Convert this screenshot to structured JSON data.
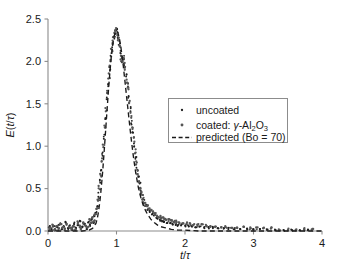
{
  "chart_data": {
    "type": "scatter",
    "title": "",
    "xlabel": "t/τ",
    "ylabel": "E(t/τ)",
    "xlim": [
      0,
      4
    ],
    "ylim": [
      0,
      2.5
    ],
    "xticks": [
      "0",
      "1",
      "2",
      "3",
      "4"
    ],
    "yticks": [
      "0.0",
      "0.5",
      "1.0",
      "1.5",
      "2.0",
      "2.5"
    ],
    "xtick_values": [
      0,
      1,
      2,
      3,
      4
    ],
    "ytick_values": [
      0.0,
      0.5,
      1.0,
      1.5,
      2.0,
      2.5
    ],
    "grid": false,
    "legend_position": "center-right",
    "series": [
      {
        "name": "uncoated",
        "type": "scatter",
        "marker": "dot",
        "color": "#1f1f1f",
        "points": [
          [
            0.02,
            0.05
          ],
          [
            0.05,
            0.02
          ],
          [
            0.08,
            0.06
          ],
          [
            0.11,
            0.01
          ],
          [
            0.14,
            0.04
          ],
          [
            0.17,
            0.08
          ],
          [
            0.2,
            0.02
          ],
          [
            0.23,
            0.05
          ],
          [
            0.26,
            0.1
          ],
          [
            0.29,
            0.03
          ],
          [
            0.32,
            0.06
          ],
          [
            0.35,
            0.02
          ],
          [
            0.38,
            0.09
          ],
          [
            0.41,
            0.04
          ],
          [
            0.44,
            0.07
          ],
          [
            0.47,
            0.12
          ],
          [
            0.5,
            0.05
          ],
          [
            0.53,
            0.08
          ],
          [
            0.56,
            0.03
          ],
          [
            0.59,
            0.11
          ],
          [
            0.62,
            0.07
          ],
          [
            0.64,
            0.14
          ],
          [
            0.66,
            0.1
          ],
          [
            0.68,
            0.18
          ],
          [
            0.7,
            0.22
          ],
          [
            0.72,
            0.3
          ],
          [
            0.74,
            0.42
          ],
          [
            0.76,
            0.58
          ],
          [
            0.78,
            0.74
          ],
          [
            0.8,
            0.92
          ],
          [
            0.82,
            1.12
          ],
          [
            0.84,
            1.32
          ],
          [
            0.86,
            1.55
          ],
          [
            0.88,
            1.74
          ],
          [
            0.9,
            1.92
          ],
          [
            0.92,
            2.08
          ],
          [
            0.94,
            2.2
          ],
          [
            0.96,
            2.3
          ],
          [
            0.98,
            2.35
          ],
          [
            1.0,
            2.36
          ],
          [
            1.02,
            2.3
          ],
          [
            1.04,
            2.22
          ],
          [
            1.06,
            2.1
          ],
          [
            1.08,
            2.02
          ],
          [
            1.1,
            2.05
          ],
          [
            1.12,
            1.95
          ],
          [
            1.14,
            1.84
          ],
          [
            1.16,
            1.72
          ],
          [
            1.18,
            1.58
          ],
          [
            1.2,
            1.44
          ],
          [
            1.22,
            1.28
          ],
          [
            1.24,
            1.14
          ],
          [
            1.26,
            1.0
          ],
          [
            1.28,
            0.86
          ],
          [
            1.3,
            0.74
          ],
          [
            1.32,
            0.63
          ],
          [
            1.34,
            0.54
          ],
          [
            1.36,
            0.46
          ],
          [
            1.38,
            0.4
          ],
          [
            1.4,
            0.34
          ],
          [
            1.43,
            0.3
          ],
          [
            1.46,
            0.26
          ],
          [
            1.49,
            0.23
          ],
          [
            1.52,
            0.2
          ],
          [
            1.55,
            0.18
          ],
          [
            1.58,
            0.16
          ],
          [
            1.61,
            0.15
          ],
          [
            1.64,
            0.13
          ],
          [
            1.67,
            0.12
          ],
          [
            1.7,
            0.11
          ],
          [
            1.74,
            0.1
          ],
          [
            1.78,
            0.09
          ],
          [
            1.82,
            0.08
          ],
          [
            1.86,
            0.08
          ],
          [
            1.9,
            0.07
          ],
          [
            1.95,
            0.07
          ],
          [
            2.0,
            0.06
          ],
          [
            2.05,
            0.06
          ],
          [
            2.1,
            0.05
          ],
          [
            2.16,
            0.05
          ],
          [
            2.22,
            0.05
          ],
          [
            2.28,
            0.04
          ],
          [
            2.34,
            0.04
          ],
          [
            2.4,
            0.04
          ],
          [
            2.48,
            0.03
          ],
          [
            2.56,
            0.03
          ],
          [
            2.64,
            0.03
          ],
          [
            2.72,
            0.03
          ],
          [
            2.8,
            0.02
          ],
          [
            2.9,
            0.02
          ],
          [
            3.0,
            0.02
          ],
          [
            3.1,
            0.02
          ],
          [
            3.2,
            0.02
          ],
          [
            3.32,
            0.01
          ],
          [
            3.44,
            0.01
          ],
          [
            3.56,
            0.01
          ],
          [
            3.68,
            0.01
          ],
          [
            3.8,
            0.01
          ]
        ]
      },
      {
        "name": "coated: γ-Al₂O₃",
        "type": "scatter",
        "marker": "dot",
        "color": "#555555",
        "points": [
          [
            0.03,
            0.03
          ],
          [
            0.07,
            0.07
          ],
          [
            0.1,
            0.02
          ],
          [
            0.13,
            0.05
          ],
          [
            0.16,
            0.02
          ],
          [
            0.19,
            0.07
          ],
          [
            0.22,
            0.04
          ],
          [
            0.25,
            0.02
          ],
          [
            0.28,
            0.08
          ],
          [
            0.31,
            0.04
          ],
          [
            0.34,
            0.03
          ],
          [
            0.37,
            0.06
          ],
          [
            0.4,
            0.02
          ],
          [
            0.43,
            0.1
          ],
          [
            0.46,
            0.05
          ],
          [
            0.49,
            0.03
          ],
          [
            0.52,
            0.09
          ],
          [
            0.55,
            0.06
          ],
          [
            0.58,
            0.04
          ],
          [
            0.61,
            0.13
          ],
          [
            0.63,
            0.09
          ],
          [
            0.65,
            0.16
          ],
          [
            0.67,
            0.12
          ],
          [
            0.69,
            0.2
          ],
          [
            0.71,
            0.26
          ],
          [
            0.73,
            0.36
          ],
          [
            0.75,
            0.5
          ],
          [
            0.77,
            0.66
          ],
          [
            0.79,
            0.84
          ],
          [
            0.81,
            1.02
          ],
          [
            0.83,
            1.22
          ],
          [
            0.85,
            1.44
          ],
          [
            0.87,
            1.64
          ],
          [
            0.89,
            1.82
          ],
          [
            0.91,
            1.99
          ],
          [
            0.93,
            2.14
          ],
          [
            0.95,
            2.25
          ],
          [
            0.97,
            2.32
          ],
          [
            0.99,
            2.37
          ],
          [
            1.01,
            2.33
          ],
          [
            1.03,
            2.26
          ],
          [
            1.05,
            2.16
          ],
          [
            1.07,
            2.06
          ],
          [
            1.09,
            2.03
          ],
          [
            1.11,
            2.0
          ],
          [
            1.13,
            1.9
          ],
          [
            1.15,
            1.78
          ],
          [
            1.17,
            1.66
          ],
          [
            1.19,
            1.52
          ],
          [
            1.21,
            1.36
          ],
          [
            1.23,
            1.22
          ],
          [
            1.25,
            1.07
          ],
          [
            1.27,
            0.93
          ],
          [
            1.29,
            0.8
          ],
          [
            1.31,
            0.68
          ],
          [
            1.33,
            0.58
          ],
          [
            1.35,
            0.5
          ],
          [
            1.37,
            0.43
          ],
          [
            1.39,
            0.37
          ],
          [
            1.42,
            0.32
          ],
          [
            1.45,
            0.29
          ],
          [
            1.48,
            0.26
          ],
          [
            1.51,
            0.24
          ],
          [
            1.54,
            0.22
          ],
          [
            1.57,
            0.2
          ],
          [
            1.6,
            0.18
          ],
          [
            1.63,
            0.17
          ],
          [
            1.66,
            0.16
          ],
          [
            1.69,
            0.15
          ],
          [
            1.72,
            0.14
          ],
          [
            1.76,
            0.13
          ],
          [
            1.8,
            0.12
          ],
          [
            1.84,
            0.11
          ],
          [
            1.88,
            0.11
          ],
          [
            1.92,
            0.1
          ],
          [
            1.97,
            0.09
          ],
          [
            2.02,
            0.09
          ],
          [
            2.07,
            0.08
          ],
          [
            2.13,
            0.08
          ],
          [
            2.19,
            0.07
          ],
          [
            2.25,
            0.07
          ],
          [
            2.31,
            0.06
          ],
          [
            2.37,
            0.06
          ],
          [
            2.44,
            0.06
          ],
          [
            2.52,
            0.05
          ],
          [
            2.6,
            0.05
          ],
          [
            2.68,
            0.04
          ],
          [
            2.76,
            0.04
          ],
          [
            2.85,
            0.04
          ],
          [
            2.95,
            0.03
          ],
          [
            3.05,
            0.03
          ],
          [
            3.15,
            0.03
          ],
          [
            3.26,
            0.03
          ],
          [
            3.38,
            0.02
          ],
          [
            3.5,
            0.02
          ],
          [
            3.62,
            0.02
          ],
          [
            3.74,
            0.02
          ],
          [
            3.86,
            0.02
          ]
        ]
      },
      {
        "name": "predicted (Bo = 70)",
        "type": "line",
        "style": "dashed",
        "color": "#1a1a1a",
        "points": [
          [
            0.0,
            0.0
          ],
          [
            0.3,
            0.0
          ],
          [
            0.5,
            0.0
          ],
          [
            0.6,
            0.01
          ],
          [
            0.65,
            0.03
          ],
          [
            0.7,
            0.09
          ],
          [
            0.72,
            0.15
          ],
          [
            0.74,
            0.24
          ],
          [
            0.76,
            0.37
          ],
          [
            0.78,
            0.53
          ],
          [
            0.8,
            0.72
          ],
          [
            0.82,
            0.94
          ],
          [
            0.84,
            1.17
          ],
          [
            0.86,
            1.4
          ],
          [
            0.88,
            1.63
          ],
          [
            0.9,
            1.84
          ],
          [
            0.92,
            2.02
          ],
          [
            0.94,
            2.17
          ],
          [
            0.96,
            2.28
          ],
          [
            0.98,
            2.34
          ],
          [
            1.0,
            2.36
          ],
          [
            1.02,
            2.34
          ],
          [
            1.04,
            2.28
          ],
          [
            1.06,
            2.19
          ],
          [
            1.08,
            2.07
          ],
          [
            1.1,
            1.94
          ],
          [
            1.12,
            1.79
          ],
          [
            1.14,
            1.64
          ],
          [
            1.16,
            1.49
          ],
          [
            1.18,
            1.34
          ],
          [
            1.2,
            1.19
          ],
          [
            1.22,
            1.05
          ],
          [
            1.24,
            0.92
          ],
          [
            1.26,
            0.8
          ],
          [
            1.28,
            0.69
          ],
          [
            1.3,
            0.6
          ],
          [
            1.32,
            0.51
          ],
          [
            1.34,
            0.44
          ],
          [
            1.36,
            0.38
          ],
          [
            1.38,
            0.33
          ],
          [
            1.4,
            0.28
          ],
          [
            1.45,
            0.2
          ],
          [
            1.5,
            0.14
          ],
          [
            1.55,
            0.1
          ],
          [
            1.6,
            0.07
          ],
          [
            1.65,
            0.05
          ],
          [
            1.7,
            0.04
          ],
          [
            1.75,
            0.03
          ],
          [
            1.8,
            0.02
          ],
          [
            1.9,
            0.01
          ],
          [
            2.0,
            0.01
          ],
          [
            2.2,
            0.0
          ],
          [
            2.6,
            0.0
          ],
          [
            3.2,
            0.0
          ],
          [
            4.0,
            0.0
          ]
        ]
      }
    ],
    "legend": [
      {
        "label": "uncoated",
        "marker": "dot-small",
        "color": "#1f1f1f"
      },
      {
        "label_prefix": "coated: ",
        "label_symbol": "γ",
        "label_suffix": "-Al",
        "sub1": "2",
        "mid": "O",
        "sub2": "3",
        "marker": "dot-small",
        "color": "#555555"
      },
      {
        "label": "predicted (Bo = 70)",
        "marker": "dashed-line",
        "color": "#1a1a1a"
      }
    ]
  },
  "axes": {
    "y_title_main": "E",
    "y_title_paren_open": "(",
    "y_title_t": "t",
    "y_title_slash": "/",
    "y_title_tau": "τ",
    "y_title_paren_close": ")",
    "x_title_t": "t",
    "x_title_slash": "/",
    "x_title_tau": "τ"
  },
  "colors": {
    "axis": "#8c8c8c",
    "text": "#1a1a1a",
    "uncoated": "#1f1f1f",
    "coated": "#555555",
    "predicted": "#1a1a1a",
    "background": "#ffffff"
  }
}
